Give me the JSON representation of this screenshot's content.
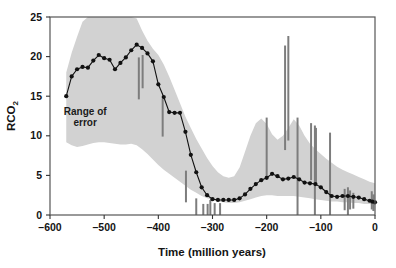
{
  "chart_data": {
    "type": "line",
    "title": "",
    "xlabel": "Time (million years)",
    "ylabel": "RCO2",
    "ylabel_main": "RCO",
    "ylabel_sub": "2",
    "xlim": [
      -600,
      0
    ],
    "ylim": [
      0,
      25
    ],
    "xticks": [
      -600,
      -500,
      -400,
      -300,
      -200,
      -100,
      0
    ],
    "xtick_labels": [
      "–600",
      "–500",
      "–400",
      "–300",
      "–200",
      "–100",
      "0"
    ],
    "yticks": [
      0,
      5,
      10,
      15,
      20,
      25
    ],
    "ytick_labels": [
      "0",
      "5",
      "10",
      "15",
      "20",
      "25"
    ],
    "grid": false,
    "legend": "none",
    "annotations": [
      {
        "text_line1": "Range of",
        "text_line2": "error",
        "x": -535,
        "y": 12.6
      }
    ],
    "band": {
      "name": "Range of error",
      "fill_color": "#d2d2d2",
      "x": [
        -570,
        -560,
        -550,
        -540,
        -530,
        -520,
        -510,
        -500,
        -490,
        -480,
        -470,
        -460,
        -450,
        -440,
        -430,
        -420,
        -410,
        -400,
        -390,
        -380,
        -370,
        -360,
        -350,
        -340,
        -330,
        -320,
        -310,
        -300,
        -290,
        -280,
        -270,
        -260,
        -250,
        -240,
        -230,
        -220,
        -210,
        -200,
        -190,
        -180,
        -170,
        -160,
        -150,
        -140,
        -130,
        -120,
        -110,
        -100,
        -90,
        -80,
        -70,
        -60,
        -50,
        -40,
        -30,
        -20,
        -10,
        0
      ],
      "upper": [
        18.0,
        20.5,
        22.5,
        24.4,
        25.0,
        25.0,
        25.0,
        25.0,
        25.0,
        25.0,
        25.0,
        25.0,
        25.0,
        24.8,
        23.3,
        22.0,
        21.0,
        20.2,
        19.0,
        17.5,
        15.8,
        14.1,
        12.4,
        11.0,
        9.6,
        8.4,
        7.2,
        6.2,
        5.4,
        4.9,
        4.7,
        4.9,
        6.0,
        8.0,
        10.0,
        11.6,
        12.2,
        11.5,
        10.2,
        9.5,
        10.0,
        11.0,
        12.1,
        11.3,
        10.0,
        9.0,
        8.3,
        7.7,
        7.1,
        6.6,
        6.1,
        5.7,
        5.4,
        5.1,
        4.8,
        4.5,
        4.2,
        4.0
      ],
      "lower": [
        9.2,
        8.8,
        8.6,
        8.7,
        8.9,
        9.1,
        9.2,
        9.2,
        9.1,
        9.0,
        8.9,
        8.9,
        9.0,
        8.8,
        8.3,
        7.7,
        7.0,
        6.3,
        5.7,
        5.2,
        4.7,
        4.2,
        3.7,
        3.2,
        2.8,
        2.4,
        2.1,
        1.9,
        1.7,
        1.6,
        1.5,
        1.5,
        1.6,
        1.8,
        2.0,
        2.2,
        2.4,
        2.5,
        2.5,
        2.4,
        2.4,
        2.4,
        2.4,
        2.3,
        2.2,
        2.1,
        2.0,
        1.9,
        1.8,
        1.7,
        1.7,
        1.6,
        1.6,
        1.5,
        1.5,
        1.4,
        1.4,
        1.3
      ]
    },
    "series": [
      {
        "name": "RCO2",
        "line_color": "#111111",
        "marker": "circle",
        "marker_color": "#111111",
        "x": [
          -570,
          -560,
          -550,
          -540,
          -530,
          -520,
          -510,
          -500,
          -490,
          -480,
          -470,
          -460,
          -450,
          -440,
          -430,
          -420,
          -410,
          -400,
          -390,
          -380,
          -370,
          -360,
          -350,
          -340,
          -330,
          -320,
          -310,
          -300,
          -290,
          -280,
          -270,
          -260,
          -250,
          -240,
          -230,
          -220,
          -210,
          -200,
          -190,
          -180,
          -170,
          -160,
          -150,
          -140,
          -130,
          -120,
          -110,
          -100,
          -90,
          -80,
          -70,
          -60,
          -50,
          -40,
          -30,
          -20,
          -10,
          -5,
          0
        ],
        "y": [
          15.0,
          17.5,
          18.4,
          18.7,
          18.6,
          19.5,
          20.2,
          19.8,
          19.6,
          18.4,
          19.2,
          19.9,
          20.8,
          21.5,
          21.1,
          20.4,
          19.4,
          16.5,
          14.9,
          13.0,
          12.9,
          12.9,
          10.5,
          7.6,
          5.4,
          3.5,
          2.5,
          2.0,
          1.9,
          1.9,
          1.9,
          1.9,
          2.1,
          2.6,
          3.3,
          3.9,
          4.4,
          4.7,
          5.2,
          4.9,
          4.5,
          4.6,
          4.8,
          4.5,
          4.1,
          4.0,
          3.9,
          3.5,
          2.9,
          2.4,
          2.3,
          2.4,
          2.4,
          2.3,
          2.2,
          2.0,
          1.8,
          1.7,
          1.6
        ]
      }
    ],
    "error_bars": {
      "color": "#7d7d7d",
      "bars": [
        {
          "x": -436,
          "y_low": 14.6,
          "y_high": 19.9
        },
        {
          "x": -429,
          "y_low": 16.0,
          "y_high": 20.2
        },
        {
          "x": -392,
          "y_low": 9.9,
          "y_high": 14.7
        },
        {
          "x": -349,
          "y_low": 1.6,
          "y_high": 5.6
        },
        {
          "x": -330,
          "y_low": 0.0,
          "y_high": 2.1
        },
        {
          "x": -317,
          "y_low": 0.0,
          "y_high": 1.4
        },
        {
          "x": -309,
          "y_low": 0.0,
          "y_high": 1.4
        },
        {
          "x": -304,
          "y_low": 0.0,
          "y_high": 1.9
        },
        {
          "x": -296,
          "y_low": 0.0,
          "y_high": 1.5
        },
        {
          "x": -286,
          "y_low": 0.0,
          "y_high": 1.5
        },
        {
          "x": -200,
          "y_low": 4.7,
          "y_high": 12.3
        },
        {
          "x": -166,
          "y_low": 8.2,
          "y_high": 21.4
        },
        {
          "x": -160,
          "y_low": 9.4,
          "y_high": 22.6
        },
        {
          "x": -143,
          "y_low": 0.0,
          "y_high": 12.3
        },
        {
          "x": -118,
          "y_low": 4.4,
          "y_high": 11.6
        },
        {
          "x": -111,
          "y_low": 0.0,
          "y_high": 11.3
        },
        {
          "x": -109,
          "y_low": 4.0,
          "y_high": 11.0
        },
        {
          "x": -83,
          "y_low": 0.0,
          "y_high": 10.4
        },
        {
          "x": -56,
          "y_low": 0.6,
          "y_high": 3.3
        },
        {
          "x": -50,
          "y_low": 0.0,
          "y_high": 3.5
        },
        {
          "x": -46,
          "y_low": 0.7,
          "y_high": 3.1
        },
        {
          "x": -40,
          "y_low": 0.8,
          "y_high": 2.8
        },
        {
          "x": -6,
          "y_low": 0.7,
          "y_high": 3.0
        },
        {
          "x": -3,
          "y_low": 0.5,
          "y_high": 2.6
        }
      ]
    }
  },
  "frame": {
    "border_color": "#4a4a4a",
    "background": "#ffffff"
  }
}
